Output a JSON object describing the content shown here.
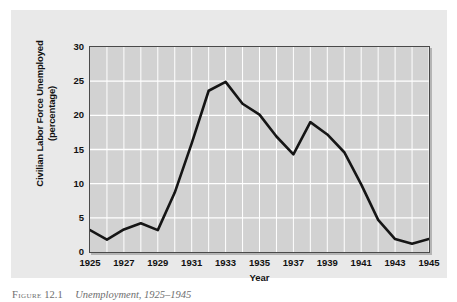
{
  "figure": {
    "caption_label": "Figure",
    "caption_number": "12.1",
    "caption_text": "Unemployment, 1925–1945"
  },
  "colors": {
    "page_background": "#ffffff",
    "panel_background": "#e9e9e9",
    "plot_background": "#d2d2d2",
    "gridline": "#ffffff",
    "axis_frame": "#4a4a4a",
    "data_line": "#151515",
    "text": "#111111"
  },
  "chart_data": {
    "type": "line",
    "title": "",
    "xlabel": "Year",
    "ylabel": "Civilian Labor Force Unemployed (percentage)",
    "ylabel_line1": "Civilian Labor Force Unemployed",
    "ylabel_line2": "(percentage)",
    "xlim": [
      1925,
      1945
    ],
    "ylim": [
      0,
      30
    ],
    "yticks": [
      0,
      5,
      10,
      15,
      20,
      25,
      30
    ],
    "ytick_labels": [
      "0",
      "5",
      "10",
      "15",
      "20",
      "25",
      "30"
    ],
    "xticks": [
      1925,
      1927,
      1929,
      1931,
      1933,
      1935,
      1937,
      1939,
      1941,
      1943,
      1945
    ],
    "xtick_labels": [
      "1925",
      "1927",
      "1929",
      "1931",
      "1933",
      "1935",
      "1937",
      "1939",
      "1941",
      "1943",
      "1945"
    ],
    "grid": true,
    "grid_x_step": 1,
    "grid_y_step": 5,
    "legend": false,
    "legend_position": "none",
    "x": [
      1925,
      1926,
      1927,
      1928,
      1929,
      1930,
      1931,
      1932,
      1933,
      1934,
      1935,
      1936,
      1937,
      1938,
      1939,
      1940,
      1941,
      1942,
      1943,
      1944,
      1945
    ],
    "values": [
      3.2,
      1.8,
      3.3,
      4.2,
      3.2,
      8.7,
      15.9,
      23.6,
      24.9,
      21.7,
      20.1,
      16.9,
      14.3,
      19.0,
      17.2,
      14.6,
      9.9,
      4.7,
      1.9,
      1.2,
      1.9
    ],
    "series": [
      {
        "name": "Civilian labor force unemployed (%)",
        "values": [
          3.2,
          1.8,
          3.3,
          4.2,
          3.2,
          8.7,
          15.9,
          23.6,
          24.9,
          21.7,
          20.1,
          16.9,
          14.3,
          19.0,
          17.2,
          14.6,
          9.9,
          4.7,
          1.9,
          1.2,
          1.9
        ]
      }
    ]
  }
}
